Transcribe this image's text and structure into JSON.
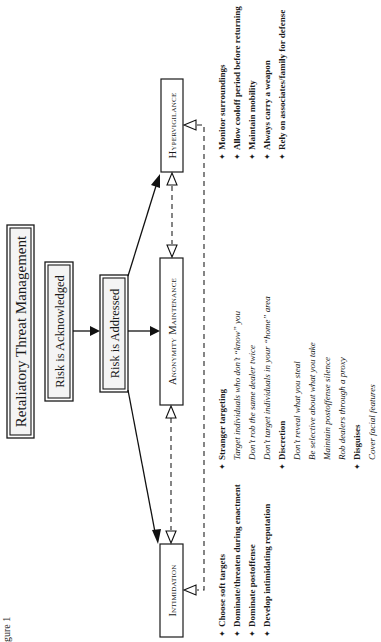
{
  "figure": {
    "caption_fragment": "gure 1",
    "title": "Retaliatory Threat Management",
    "stages": {
      "acknowledged": "Risk is Acknowledged",
      "addressed": "Risk is Addressed"
    },
    "strategies": {
      "hypervigilance": {
        "label": "Hypervigilance",
        "items": [
          "Monitor surroundings",
          "Allow cooloff period before returning",
          "Maintain mobility",
          "Always carry a weapon",
          "Rely on associates/family for defense"
        ]
      },
      "anonymity": {
        "label": "Anonymity Maintenance",
        "groups": [
          {
            "heading": "Stranger targeting",
            "items": [
              "Target individuals who don’t “know” you",
              "Don’t rob the same dealer twice",
              "Don’t target individuals in your “home” area"
            ]
          },
          {
            "heading": "Discretion",
            "items": [
              "Don’t reveal what you steal",
              "Be selective about what you take",
              "Maintain postoffense silence",
              "Rob dealers through a proxy"
            ]
          },
          {
            "heading": "Disguises",
            "items": [
              "Cover facial features"
            ]
          }
        ]
      },
      "intimidation": {
        "label": "Intimidation",
        "items": [
          "Choose soft targets",
          "Dominate/threaten during enactment",
          "Dominate postoffense",
          "Develop intimidating reputation"
        ]
      }
    },
    "bullet_glyph": "✦"
  }
}
